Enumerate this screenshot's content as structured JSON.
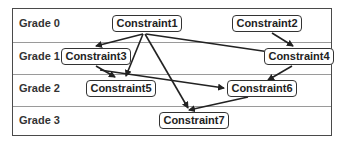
{
  "grades": [
    {
      "label": "Grade 0"
    },
    {
      "label": "Grade 1"
    },
    {
      "label": "Grade 2"
    },
    {
      "label": "Grade 3"
    }
  ],
  "nodes": [
    {
      "id": "c1",
      "label": "Constraint1",
      "grade": 0
    },
    {
      "id": "c2",
      "label": "Constraint2",
      "grade": 0
    },
    {
      "id": "c3",
      "label": "Constraint3",
      "grade": 1
    },
    {
      "id": "c4",
      "label": "Constraint4",
      "grade": 1
    },
    {
      "id": "c5",
      "label": "Constraint5",
      "grade": 2
    },
    {
      "id": "c6",
      "label": "Constraint6",
      "grade": 2
    },
    {
      "id": "c7",
      "label": "Constraint7",
      "grade": 3
    }
  ],
  "edges": [
    {
      "from": "Constraint1",
      "to": "Constraint3"
    },
    {
      "from": "Constraint1",
      "to": "Constraint5"
    },
    {
      "from": "Constraint1",
      "to": "Constraint4"
    },
    {
      "from": "Constraint1",
      "to": "Constraint7"
    },
    {
      "from": "Constraint2",
      "to": "Constraint4"
    },
    {
      "from": "Constraint3",
      "to": "Constraint5"
    },
    {
      "from": "Constraint3",
      "to": "Constraint6"
    },
    {
      "from": "Constraint4",
      "to": "Constraint6"
    },
    {
      "from": "Constraint6",
      "to": "Constraint7"
    }
  ]
}
